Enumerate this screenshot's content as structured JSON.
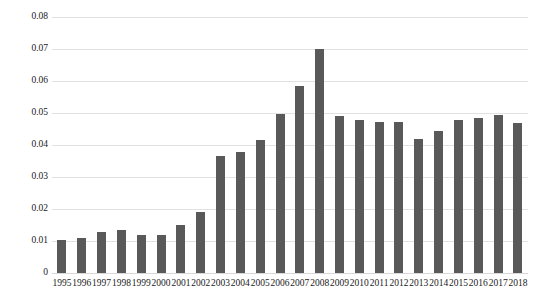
{
  "chart_data": {
    "type": "bar",
    "title": "",
    "subtitle": "",
    "xlabel": "",
    "ylabel": "",
    "categories": [
      "1995",
      "1996",
      "1997",
      "1998",
      "1999",
      "2000",
      "2001",
      "2002",
      "2003",
      "2004",
      "2005",
      "2006",
      "2007",
      "2008",
      "2009",
      "2010",
      "2011",
      "2012",
      "2013",
      "2014",
      "2015",
      "2016",
      "2017",
      "2018"
    ],
    "values": [
      0.0103,
      0.0108,
      0.0127,
      0.0135,
      0.012,
      0.0118,
      0.0151,
      0.019,
      0.0365,
      0.0378,
      0.0415,
      0.0496,
      0.0585,
      0.07,
      0.0491,
      0.0479,
      0.0473,
      0.0472,
      0.0419,
      0.0445,
      0.0478,
      0.0483,
      0.0495,
      0.047
    ],
    "ylim": [
      0,
      0.08
    ],
    "ytick_labels": [
      "0.08",
      "0.07",
      "0.06",
      "0.05",
      "0.04",
      "0.03",
      "0.02",
      "0.01",
      "0"
    ],
    "ytick_values": [
      0.08,
      0.07,
      0.06,
      0.05,
      0.04,
      0.03,
      0.02,
      0.01,
      0
    ],
    "grid": true,
    "legend": "none",
    "series_name": "",
    "bar_color": "#595959",
    "gridline_color": "#e2e2e2",
    "background_color": "#ffffff"
  }
}
